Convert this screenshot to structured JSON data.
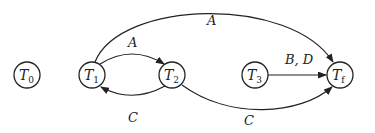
{
  "diagram": {
    "type": "state-transition-graph",
    "nodes": [
      {
        "id": "T0",
        "base": "T",
        "sub": "0",
        "x": 27,
        "y": 75
      },
      {
        "id": "T1",
        "base": "T",
        "sub": "1",
        "x": 92,
        "y": 75
      },
      {
        "id": "T2",
        "base": "T",
        "sub": "2",
        "x": 172,
        "y": 75
      },
      {
        "id": "T3",
        "base": "T",
        "sub": "3",
        "x": 255,
        "y": 75
      },
      {
        "id": "Tf",
        "base": "T",
        "sub": "f",
        "x": 340,
        "y": 75
      }
    ],
    "edges": [
      {
        "from": "T1",
        "to": "T2",
        "label": "A"
      },
      {
        "from": "T2",
        "to": "T1",
        "label": "C"
      },
      {
        "from": "T1",
        "to": "Tf",
        "label": "A"
      },
      {
        "from": "T3",
        "to": "Tf",
        "label": "B, D"
      },
      {
        "from": "T2",
        "to": "Tf",
        "label": "C"
      }
    ]
  }
}
